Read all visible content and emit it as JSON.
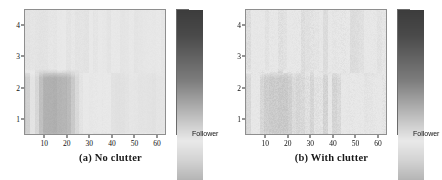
{
  "figure": {
    "panels": [
      {
        "id": "panel-a",
        "caption": "(a) No clutter",
        "colorbar_label": "Follower"
      },
      {
        "id": "panel-b",
        "caption": "(b) With clutter",
        "colorbar_label": "Follower"
      }
    ]
  },
  "chart_data": [
    {
      "type": "heatmap",
      "title": "(a) No clutter",
      "xlabel": "",
      "ylabel": "",
      "colorbar_label": "Follower",
      "colormap": "gray-bone-symmetric",
      "colormap_stops": [
        {
          "pos": 0.0,
          "hex": "#3c3c3c"
        },
        {
          "pos": 0.1,
          "hex": "#4a4a4a"
        },
        {
          "pos": 0.28,
          "hex": "#7d7d7d"
        },
        {
          "pos": 0.46,
          "hex": "#cfcfcf"
        },
        {
          "pos": 0.52,
          "hex": "#e9e9e9"
        },
        {
          "pos": 0.6,
          "hex": "#d2d2d2"
        },
        {
          "pos": 0.78,
          "hex": "#8c8c8c"
        },
        {
          "pos": 0.92,
          "hex": "#565656"
        },
        {
          "pos": 1.0,
          "hex": "#3a3a3a"
        }
      ],
      "xlim": [
        1,
        64
      ],
      "ylim": [
        0.5,
        4.5
      ],
      "xticks": [
        10,
        20,
        30,
        40,
        50,
        60
      ],
      "yticks": [
        1,
        2,
        3,
        4
      ],
      "grid": false,
      "ncols": 64,
      "nrows": 4,
      "row_order_top_to_bottom": [
        4,
        3,
        2,
        1
      ],
      "noise_amplitude": 0.012,
      "rows": [
        {
          "label": "4",
          "base": 0.52,
          "segments": [
            {
              "from": 1,
              "to": 18,
              "value": 0.515
            },
            {
              "from": 18,
              "to": 30,
              "value": 0.535
            },
            {
              "from": 30,
              "to": 44,
              "value": 0.53
            },
            {
              "from": 44,
              "to": 64,
              "value": 0.525
            }
          ]
        },
        {
          "label": "3",
          "base": 0.535,
          "segments": [
            {
              "from": 1,
              "to": 3,
              "value": 0.62
            },
            {
              "from": 3,
              "to": 12,
              "value": 0.4
            },
            {
              "from": 12,
              "to": 20,
              "value": 0.52
            },
            {
              "from": 20,
              "to": 64,
              "value": 0.545
            }
          ]
        },
        {
          "label": "2",
          "base": 0.46,
          "segments": [
            {
              "from": 1,
              "to": 14,
              "value": 0.48
            },
            {
              "from": 14,
              "to": 34,
              "value": 0.43
            },
            {
              "from": 34,
              "to": 40,
              "value": 0.47
            },
            {
              "from": 40,
              "to": 58,
              "value": 0.425
            },
            {
              "from": 58,
              "to": 64,
              "value": 0.455
            }
          ]
        },
        {
          "label": "1",
          "base": 0.63,
          "segments": [
            {
              "from": 1,
              "to": 3,
              "value": 0.56
            },
            {
              "from": 3,
              "to": 10,
              "value": 0.42
            },
            {
              "from": 10,
              "to": 64,
              "value": 0.66
            }
          ]
        }
      ]
    },
    {
      "type": "heatmap",
      "title": "(b) With clutter",
      "xlabel": "",
      "ylabel": "",
      "colorbar_label": "Follower",
      "colormap": "gray-bone-symmetric",
      "colormap_stops": [
        {
          "pos": 0.0,
          "hex": "#3c3c3c"
        },
        {
          "pos": 0.1,
          "hex": "#4a4a4a"
        },
        {
          "pos": 0.28,
          "hex": "#7d7d7d"
        },
        {
          "pos": 0.46,
          "hex": "#cfcfcf"
        },
        {
          "pos": 0.52,
          "hex": "#e9e9e9"
        },
        {
          "pos": 0.6,
          "hex": "#d2d2d2"
        },
        {
          "pos": 0.78,
          "hex": "#8c8c8c"
        },
        {
          "pos": 0.92,
          "hex": "#565656"
        },
        {
          "pos": 1.0,
          "hex": "#3a3a3a"
        }
      ],
      "xlim": [
        1,
        64
      ],
      "ylim": [
        0.5,
        4.5
      ],
      "xticks": [
        10,
        20,
        30,
        40,
        50,
        60
      ],
      "yticks": [
        1,
        2,
        3,
        4
      ],
      "grid": false,
      "ncols": 64,
      "nrows": 4,
      "row_order_top_to_bottom": [
        4,
        3,
        2,
        1
      ],
      "noise_amplitude": 0.03,
      "rows": [
        {
          "label": "4",
          "base": 0.525,
          "segments": [
            {
              "from": 1,
              "to": 16,
              "value": 0.52
            },
            {
              "from": 16,
              "to": 30,
              "value": 0.54
            },
            {
              "from": 30,
              "to": 46,
              "value": 0.53
            },
            {
              "from": 46,
              "to": 64,
              "value": 0.522
            }
          ]
        },
        {
          "label": "3",
          "base": 0.525,
          "segments": [
            {
              "from": 1,
              "to": 3,
              "value": 0.6
            },
            {
              "from": 3,
              "to": 11,
              "value": 0.44
            },
            {
              "from": 11,
              "to": 22,
              "value": 0.495
            },
            {
              "from": 22,
              "to": 44,
              "value": 0.515
            },
            {
              "from": 44,
              "to": 64,
              "value": 0.535
            }
          ]
        },
        {
          "label": "2",
          "base": 0.515,
          "segments": [
            {
              "from": 1,
              "to": 13,
              "value": 0.54
            },
            {
              "from": 13,
              "to": 26,
              "value": 0.495
            },
            {
              "from": 26,
              "to": 36,
              "value": 0.47
            },
            {
              "from": 36,
              "to": 44,
              "value": 0.52
            },
            {
              "from": 44,
              "to": 52,
              "value": 0.465
            },
            {
              "from": 52,
              "to": 64,
              "value": 0.52
            }
          ]
        },
        {
          "label": "1",
          "base": 0.565,
          "segments": [
            {
              "from": 1,
              "to": 3,
              "value": 0.545
            },
            {
              "from": 3,
              "to": 10,
              "value": 0.48
            },
            {
              "from": 10,
              "to": 64,
              "value": 0.58
            }
          ]
        }
      ]
    }
  ]
}
